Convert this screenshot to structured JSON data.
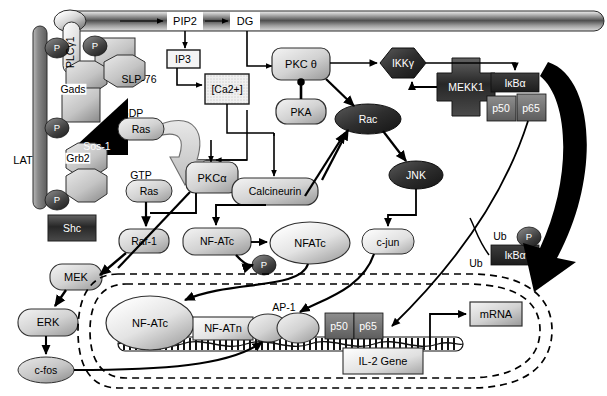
{
  "diagram": {
    "type": "biological-pathway",
    "width": 607,
    "height": 396,
    "colors": {
      "background": "#ffffff",
      "stroke": "#000000",
      "node_light": "#d8d8d8",
      "node_mid": "#a8a8a8",
      "node_dark": "#3a3a3a",
      "membrane": "#6f6f6f",
      "phosphate": "#4a4a4a",
      "black": "#000000"
    }
  },
  "membrane": {
    "label_lat": "LAT",
    "label_pip2": "PIP2",
    "label_dg": "DG"
  },
  "phosphates": [
    {
      "name": "P",
      "label": "P"
    },
    {
      "name": "P",
      "label": "P"
    },
    {
      "name": "P",
      "label": "P"
    },
    {
      "name": "P",
      "label": "P"
    },
    {
      "name": "P",
      "label": "P"
    },
    {
      "name": "P",
      "label": "P"
    }
  ],
  "nodes": {
    "plcg1": "PLCγ1",
    "gads": "Gads",
    "slp76": "SLP-76",
    "sos1": "Sos-1",
    "grb2": "Grb2",
    "shc": "Shc",
    "ras_gdp_tag": "GDP",
    "ras_gdp": "Ras",
    "ras_gtp_tag": "GTP",
    "ras_gtp": "Ras",
    "ip3": "IP3",
    "calcium": "[Ca2+]",
    "calcium_sup": "2+",
    "pkc_theta": "PKC θ",
    "pka": "PKA",
    "pkc_alpha": "PKCα",
    "calcineurin": "Calcineurin",
    "rac": "Rac",
    "jnk": "JNK",
    "cjun": "c-jun",
    "ikk_gamma": "IKKγ",
    "mekk1": "MEKK1",
    "ikba": "IκBα",
    "p50": "p50",
    "p65": "p65",
    "raf1": "Raf-1",
    "mek": "MEK",
    "erk": "ERK",
    "cfos": "c-fos",
    "nfatc_cyto": "NF-ATc",
    "nfatc_dephos": "NFATc",
    "nfatc_nuc": "NF-ATc",
    "nfatn": "NF-ATn",
    "ap1": "AP-1",
    "p50_nuc": "p50",
    "p65_nuc": "p65",
    "il2_gene": "IL-2 Gene",
    "mrna": "mRNA",
    "ub_1": "Ub",
    "ub_2": "Ub",
    "ikba_degraded": "IκBα"
  }
}
